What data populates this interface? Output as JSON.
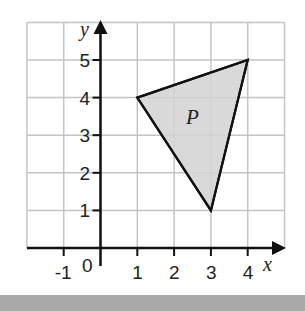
{
  "diagram": {
    "type": "coordinate-grid",
    "x_axis": {
      "label": "x",
      "range": [
        -2,
        5
      ],
      "tick_labels": [
        "-1",
        "1",
        "2",
        "3",
        "4"
      ],
      "origin_label": "0"
    },
    "y_axis": {
      "label": "y",
      "range": [
        0,
        6
      ],
      "tick_labels": [
        "1",
        "2",
        "3",
        "4",
        "5"
      ]
    },
    "shapes": [
      {
        "name": "P",
        "type": "triangle",
        "vertices": [
          [
            1,
            4
          ],
          [
            4,
            5
          ],
          [
            3,
            1
          ]
        ],
        "fill": "#d9d9d9",
        "stroke": "#111111"
      }
    ],
    "colors": {
      "grid": "#c4c4c4",
      "axis": "#111111",
      "footer_band": "#a9a9a9"
    }
  }
}
